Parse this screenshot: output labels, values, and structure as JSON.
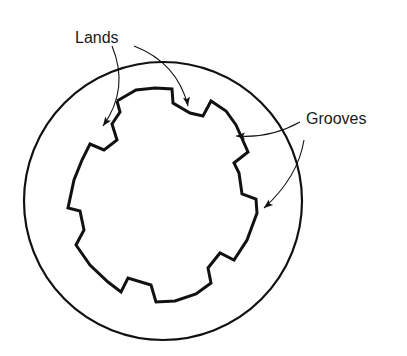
{
  "diagram": {
    "labels": {
      "lands": "Lands",
      "grooves": "Grooves"
    },
    "colors": {
      "stroke": "#111111",
      "background": "#ffffff",
      "text": "#1a1a1a"
    },
    "outer_circle": {
      "cx": 163,
      "cy": 201,
      "r": 139,
      "stroke_width": 2.2
    },
    "bore_outline": {
      "stroke_width": 3,
      "points": [
        [
          117,
          101
        ],
        [
          120,
          112
        ],
        [
          112,
          124
        ],
        [
          117,
          140
        ],
        [
          104,
          150
        ],
        [
          90,
          144
        ],
        [
          82,
          160
        ],
        [
          74,
          180
        ],
        [
          68,
          208
        ],
        [
          80,
          211
        ],
        [
          84,
          230
        ],
        [
          76,
          245
        ],
        [
          90,
          265
        ],
        [
          108,
          282
        ],
        [
          121,
          292
        ],
        [
          128,
          278
        ],
        [
          151,
          285
        ],
        [
          156,
          302
        ],
        [
          175,
          301
        ],
        [
          196,
          294
        ],
        [
          211,
          283
        ],
        [
          208,
          268
        ],
        [
          220,
          253
        ],
        [
          234,
          260
        ],
        [
          247,
          240
        ],
        [
          257,
          213
        ],
        [
          256,
          199
        ],
        [
          242,
          194
        ],
        [
          239,
          173
        ],
        [
          234,
          163
        ],
        [
          248,
          152
        ],
        [
          236,
          125
        ],
        [
          226,
          111
        ],
        [
          211,
          101
        ],
        [
          203,
          116
        ],
        [
          190,
          113
        ],
        [
          173,
          103
        ],
        [
          172,
          89
        ],
        [
          155,
          88
        ],
        [
          136,
          90
        ],
        [
          117,
          101
        ]
      ]
    },
    "arrows": [
      {
        "name": "lands-arrow-left",
        "path": "M 112 46 C 122 70, 123 98, 103 126",
        "head": [
          103,
          126
        ],
        "angle": 125
      },
      {
        "name": "lands-arrow-right",
        "path": "M 134 46 C 160 56, 180 74, 188 106",
        "head": [
          188,
          106
        ],
        "angle": 80
      },
      {
        "name": "grooves-arrow-upper",
        "path": "M 300 122 C 282 132, 260 138, 236 136",
        "head": [
          236,
          136
        ],
        "angle": 180
      },
      {
        "name": "grooves-arrow-lower",
        "path": "M 304 140 C 300 165, 286 188, 264 208",
        "head": [
          264,
          208
        ],
        "angle": 140
      }
    ]
  }
}
